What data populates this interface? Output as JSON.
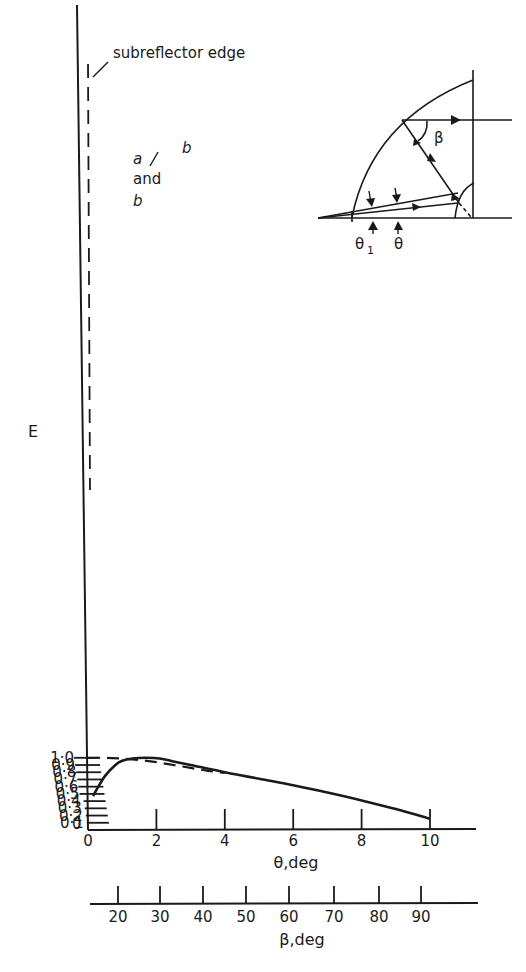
{
  "chart_data": {
    "type": "line",
    "title": "",
    "xlabel": "θ,deg",
    "ylabel": "E",
    "secondary_xlabel": "β,deg",
    "xlim": [
      0,
      11
    ],
    "ylim": [
      0,
      1.05
    ],
    "grid": false,
    "legend": "inline labels on curves",
    "x_ticks": [
      "0",
      "2",
      "4",
      "6",
      "8",
      "10"
    ],
    "y_ticks": [
      "0",
      "0·1",
      "0·2",
      "0·3",
      "0·4",
      "0·5",
      "0·6",
      "0·7",
      "0·8",
      "0·9",
      "1·0"
    ],
    "secondary_x_ticks": [
      "20",
      "30",
      "40",
      "50",
      "60",
      "70",
      "80",
      "90"
    ],
    "series": [
      {
        "name": "b",
        "style": "solid",
        "x": [
          0.15,
          0.3,
          0.5,
          0.8,
          1.0,
          1.3,
          1.7,
          2.1,
          2.5,
          3.0,
          4.0,
          5.0,
          6.0,
          7.0,
          8.0,
          9.0,
          10.0
        ],
        "y": [
          0.47,
          0.6,
          0.75,
          0.9,
          0.96,
          0.99,
          1.0,
          0.99,
          0.95,
          0.9,
          0.8,
          0.71,
          0.62,
          0.52,
          0.41,
          0.29,
          0.155
        ]
      },
      {
        "name": "a",
        "style": "dashed",
        "x": [
          0.0,
          0.5,
          1.0,
          1.5,
          2.0,
          2.5,
          3.0,
          3.5,
          4.0
        ],
        "y": [
          1.0,
          1.0,
          0.99,
          0.97,
          0.94,
          0.9,
          0.86,
          0.82,
          0.79
        ]
      }
    ],
    "annotations": [
      {
        "text": "subreflector edge",
        "note": "dashed vertical line near θ≈0"
      },
      {
        "text": "a",
        "note": "dashed curve label"
      },
      {
        "text": "and",
        "note": "label connector"
      },
      {
        "text": "b",
        "note": "curves a and b coincide beyond ~4 deg"
      },
      {
        "text": "b",
        "note": "solid curve label"
      }
    ],
    "inset_diagram": {
      "description": "Reflector geometry sketch with rays",
      "labels": [
        "β",
        "θ1",
        "θ"
      ]
    }
  },
  "labels": {
    "subreflector": "subreflector edge",
    "curve_a": "a",
    "and": "and",
    "curve_b_lower": "b",
    "curve_b_upper": "b",
    "y_axis": "E",
    "x_axis": "θ,deg",
    "beta_axis": "β,deg",
    "inset_beta": "β",
    "inset_theta1_base": "θ",
    "inset_theta1_sub": "1",
    "inset_theta": "θ",
    "origin": "0"
  },
  "colors": {
    "ink": "#1a1a1a",
    "background": "#ffffff"
  }
}
